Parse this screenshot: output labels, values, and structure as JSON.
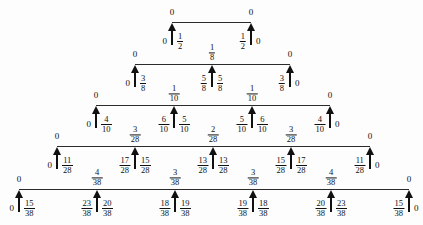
{
  "figure": {
    "type": "tree-diagram",
    "line_color": "#2b2b2b",
    "text_color": "#111111",
    "background": "#fdfdfd",
    "zero_label": "0"
  },
  "levels": [
    {
      "index": 0,
      "denominator": 2,
      "line": {
        "x1": 172,
        "x2": 251,
        "y": 22
      },
      "above_labels": [
        {
          "x": 172,
          "text": "0",
          "kind": "whole"
        },
        {
          "x": 251,
          "text": "0",
          "kind": "whole"
        }
      ],
      "arrows": [
        {
          "x": 172,
          "left": "0",
          "left_kind": "whole",
          "right_num": "1",
          "right_den": "2"
        },
        {
          "x": 251,
          "left_num": "1",
          "left_den": "2",
          "right": "0",
          "right_kind": "whole"
        }
      ]
    },
    {
      "index": 1,
      "denominator": 8,
      "line": {
        "x1": 135,
        "x2": 290,
        "y": 64
      },
      "above_labels": [
        {
          "x": 135,
          "text": "0",
          "kind": "whole"
        },
        {
          "x": 212,
          "num": "1",
          "den": "8",
          "kind": "frac"
        },
        {
          "x": 290,
          "text": "0",
          "kind": "whole"
        }
      ],
      "arrows": [
        {
          "x": 135,
          "left": "0",
          "left_kind": "whole",
          "right_num": "3",
          "right_den": "8"
        },
        {
          "x": 212,
          "left_num": "5",
          "left_den": "8",
          "right_num": "5",
          "right_den": "8"
        },
        {
          "x": 290,
          "left_num": "3",
          "left_den": "8",
          "right": "0",
          "right_kind": "whole"
        }
      ]
    },
    {
      "index": 2,
      "denominator": 10,
      "line": {
        "x1": 96,
        "x2": 330,
        "y": 105
      },
      "above_labels": [
        {
          "x": 96,
          "text": "0",
          "kind": "whole"
        },
        {
          "x": 174,
          "num": "1",
          "den": "10",
          "kind": "frac"
        },
        {
          "x": 252,
          "num": "1",
          "den": "10",
          "kind": "frac"
        },
        {
          "x": 330,
          "text": "0",
          "kind": "whole"
        }
      ],
      "arrows": [
        {
          "x": 96,
          "left": "0",
          "left_kind": "whole",
          "right_num": "4",
          "right_den": "10"
        },
        {
          "x": 174,
          "left_num": "6",
          "left_den": "10",
          "right_num": "5",
          "right_den": "10"
        },
        {
          "x": 252,
          "left_num": "5",
          "left_den": "10",
          "right_num": "6",
          "right_den": "10"
        },
        {
          "x": 330,
          "left_num": "4",
          "left_den": "10",
          "right": "0",
          "right_kind": "whole"
        }
      ]
    },
    {
      "index": 3,
      "denominator": 28,
      "line": {
        "x1": 57,
        "x2": 370,
        "y": 146
      },
      "above_labels": [
        {
          "x": 57,
          "text": "0",
          "kind": "whole"
        },
        {
          "x": 135,
          "num": "3",
          "den": "28",
          "kind": "frac"
        },
        {
          "x": 213,
          "num": "2",
          "den": "28",
          "kind": "frac"
        },
        {
          "x": 291,
          "num": "3",
          "den": "28",
          "kind": "frac"
        },
        {
          "x": 370,
          "text": "0",
          "kind": "whole"
        }
      ],
      "arrows": [
        {
          "x": 57,
          "left": "0",
          "left_kind": "whole",
          "right_num": "11",
          "right_den": "28"
        },
        {
          "x": 135,
          "left_num": "17",
          "left_den": "28",
          "right_num": "15",
          "right_den": "28"
        },
        {
          "x": 213,
          "left_num": "13",
          "left_den": "28",
          "right_num": "13",
          "right_den": "28"
        },
        {
          "x": 291,
          "left_num": "15",
          "left_den": "28",
          "right_num": "17",
          "right_den": "28"
        },
        {
          "x": 370,
          "left_num": "11",
          "left_den": "28",
          "right": "0",
          "right_kind": "whole"
        }
      ]
    },
    {
      "index": 4,
      "denominator": 38,
      "line": {
        "x1": 19,
        "x2": 409,
        "y": 189
      },
      "above_labels": [
        {
          "x": 19,
          "text": "0",
          "kind": "whole"
        },
        {
          "x": 97,
          "num": "4",
          "den": "38",
          "kind": "frac"
        },
        {
          "x": 175,
          "num": "3",
          "den": "38",
          "kind": "frac"
        },
        {
          "x": 253,
          "num": "3",
          "den": "38",
          "kind": "frac"
        },
        {
          "x": 331,
          "num": "4",
          "den": "38",
          "kind": "frac"
        },
        {
          "x": 409,
          "text": "0",
          "kind": "whole"
        }
      ],
      "arrows": [
        {
          "x": 19,
          "left": "0",
          "left_kind": "whole",
          "right_num": "15",
          "right_den": "38"
        },
        {
          "x": 97,
          "left_num": "23",
          "left_den": "38",
          "right_num": "20",
          "right_den": "38"
        },
        {
          "x": 175,
          "left_num": "18",
          "left_den": "38",
          "right_num": "19",
          "right_den": "38"
        },
        {
          "x": 253,
          "left_num": "19",
          "left_den": "38",
          "right_num": "18",
          "right_den": "38"
        },
        {
          "x": 331,
          "left_num": "20",
          "left_den": "38",
          "right_num": "23",
          "right_den": "38"
        },
        {
          "x": 409,
          "left_num": "15",
          "left_den": "38",
          "right": "0",
          "right_kind": "whole"
        }
      ]
    }
  ]
}
